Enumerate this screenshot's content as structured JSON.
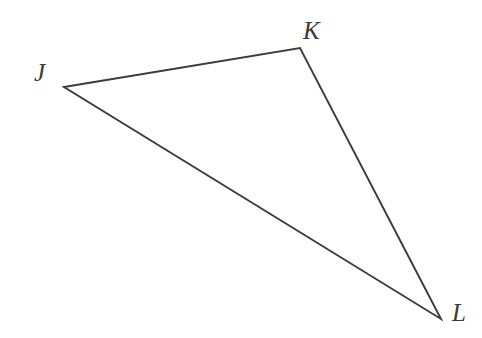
{
  "figure": {
    "name": "triangle-jkl",
    "width": 482,
    "height": 338,
    "background_color": "#ffffff",
    "stroke_color": "#3c3c3c",
    "stroke_width": 1.9,
    "label_color": "#3a3a3a"
  },
  "vertices": [
    {
      "id": "J",
      "label": "J",
      "x": 64,
      "y": 87,
      "label_x": 34,
      "label_y": 60
    },
    {
      "id": "K",
      "label": "K",
      "x": 300,
      "y": 48,
      "label_x": 303,
      "label_y": 18
    },
    {
      "id": "L",
      "label": "L",
      "x": 441,
      "y": 319,
      "label_x": 452,
      "label_y": 300
    }
  ],
  "edges": [
    {
      "id": "JK",
      "from": "J",
      "to": "K"
    },
    {
      "id": "KL",
      "from": "K",
      "to": "L"
    },
    {
      "id": "LJ",
      "from": "L",
      "to": "J"
    }
  ],
  "polygon_points": "64,87 300,48 441,319"
}
